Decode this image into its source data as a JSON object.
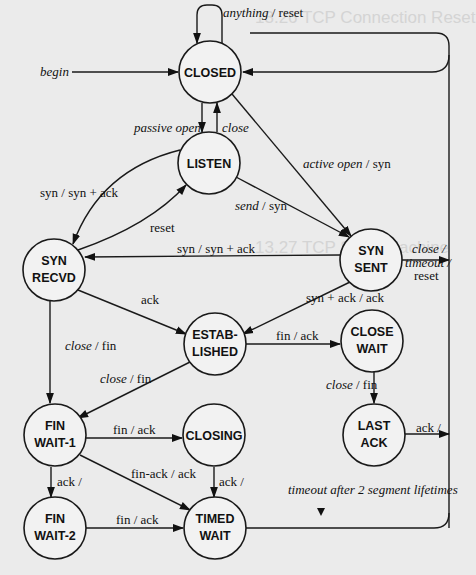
{
  "states": {
    "closed": {
      "lines": [
        "CLOSED"
      ]
    },
    "listen": {
      "lines": [
        "LISTEN"
      ]
    },
    "syn_recvd": {
      "lines": [
        "SYN",
        "RECVD"
      ]
    },
    "syn_sent": {
      "lines": [
        "SYN",
        "SENT"
      ]
    },
    "established": {
      "lines": [
        "ESTAB-",
        "LISHED"
      ]
    },
    "close_wait": {
      "lines": [
        "CLOSE",
        "WAIT"
      ]
    },
    "fin_wait_1": {
      "lines": [
        "FIN",
        "WAIT-1"
      ]
    },
    "closing": {
      "lines": [
        "CLOSING"
      ]
    },
    "last_ack": {
      "lines": [
        "LAST",
        "ACK"
      ]
    },
    "fin_wait_2": {
      "lines": [
        "FIN",
        "WAIT-2"
      ]
    },
    "timed_wait": {
      "lines": [
        "TIMED",
        "WAIT"
      ]
    }
  },
  "transitions": {
    "closed_self": {
      "event": "anything",
      "action": " / reset"
    },
    "begin": {
      "event": "begin",
      "action": ""
    },
    "passive_open": {
      "event": "passive open",
      "action": ""
    },
    "close_listen": {
      "event": "close",
      "action": ""
    },
    "active_open": {
      "event": "active open",
      "action": " / syn"
    },
    "listen_syn": {
      "event": "",
      "action": "syn / syn + ack"
    },
    "reset": {
      "event": "",
      "action": "reset"
    },
    "send_syn": {
      "event": "send",
      "action": " / syn"
    },
    "synsent_synrecvd": {
      "event": "",
      "action": "syn / syn + ack"
    },
    "synsent_close_1": {
      "event": "close /",
      "action": ""
    },
    "synsent_close_2": {
      "event": "timeout /",
      "action": ""
    },
    "synsent_close_3": {
      "event": "",
      "action": "reset"
    },
    "synrecvd_ack": {
      "event": "",
      "action": "ack"
    },
    "synsent_est": {
      "event": "",
      "action": "syn + ack / ack"
    },
    "synrecvd_close": {
      "event": "close",
      "action": " / fin"
    },
    "est_close": {
      "event": "close",
      "action": " / fin"
    },
    "est_finack": {
      "event": "",
      "action": "fin / ack"
    },
    "closewait_close": {
      "event": "close",
      "action": " / fin"
    },
    "finwait1_finack": {
      "event": "",
      "action": "fin / ack"
    },
    "finwait1_finackack": {
      "event": "",
      "action": "fin-ack / ack"
    },
    "finwait1_ack": {
      "event": "",
      "action": "ack /"
    },
    "closing_ack": {
      "event": "",
      "action": "ack /"
    },
    "lastack_ack": {
      "event": "",
      "action": "ack /"
    },
    "finwait2_finack": {
      "event": "",
      "action": "fin / ack"
    },
    "timeout": {
      "event": "timeout after 2 segment lifetimes",
      "action": ""
    }
  },
  "bleed_text": {
    "heading1": "13.26 TCP Connection Reset",
    "heading2": "13.27 TCP State Machine"
  }
}
